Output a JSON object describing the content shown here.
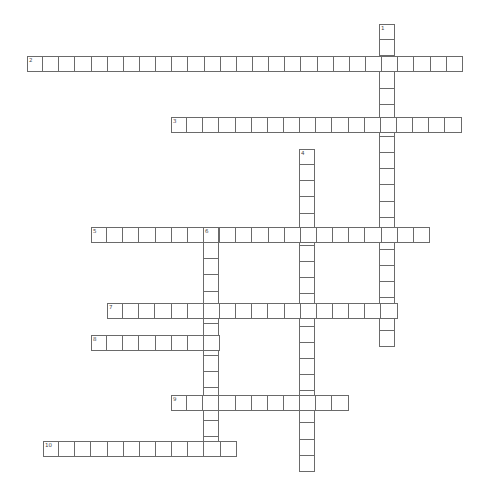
{
  "puzzle": {
    "cell_size": 16.15,
    "words": [
      {
        "number": "1",
        "direction": "down",
        "x": 379,
        "y": 24,
        "length": 20
      },
      {
        "number": "2",
        "direction": "across",
        "x": 27,
        "y": 56,
        "length": 27
      },
      {
        "number": "3",
        "direction": "across",
        "x": 171,
        "y": 117,
        "length": 18
      },
      {
        "number": "4",
        "direction": "down",
        "x": 299,
        "y": 149,
        "length": 20
      },
      {
        "number": "5",
        "direction": "across",
        "x": 91,
        "y": 227,
        "length": 21
      },
      {
        "number": "6",
        "direction": "down",
        "x": 203,
        "y": 227,
        "length": 14
      },
      {
        "number": "7",
        "direction": "across",
        "x": 107,
        "y": 303,
        "length": 18
      },
      {
        "number": "8",
        "direction": "across",
        "x": 91,
        "y": 335,
        "length": 8
      },
      {
        "number": "9",
        "direction": "across",
        "x": 171,
        "y": 395,
        "length": 11
      },
      {
        "number": "10",
        "direction": "across",
        "x": 43,
        "y": 441,
        "length": 12
      }
    ]
  }
}
